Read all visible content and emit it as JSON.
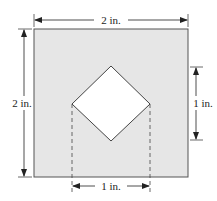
{
  "diagram": {
    "outer_square": {
      "side": "2 in.",
      "fill": "#e6e6e6",
      "stroke": "#555555"
    },
    "inner_diamond": {
      "fill": "#ffffff",
      "stroke": "#444444"
    },
    "dimensions": {
      "top_width": "2 in.",
      "left_height": "2 in.",
      "right_height": "1 in.",
      "bottom_width": "1 in."
    }
  }
}
